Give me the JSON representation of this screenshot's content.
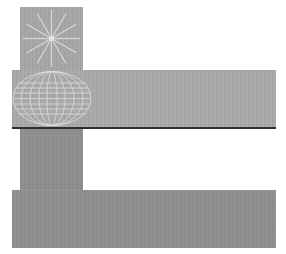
{
  "figure": {
    "colors": {
      "background": "#ffffff",
      "top_square": "#a6a6a6",
      "mid_band": "#a9a9a9",
      "mid_band_border": "#2e2e2e",
      "stem": "#8e8e8e",
      "bottom_band": "#8f8f8f",
      "line_art": "#e6e6e6"
    },
    "elements": [
      {
        "name": "top-square",
        "pattern": "radial-starburst"
      },
      {
        "name": "mid-band",
        "pattern": "wireframe-sphere"
      },
      {
        "name": "stem",
        "pattern": "none"
      },
      {
        "name": "bottom-band",
        "pattern": "none"
      }
    ]
  }
}
